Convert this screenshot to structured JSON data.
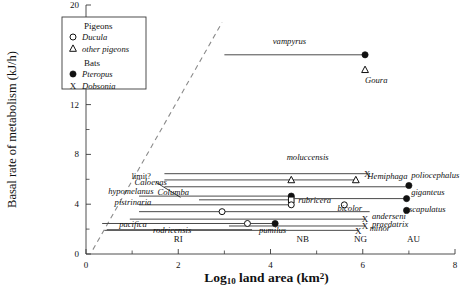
{
  "chart_data": {
    "type": "scatter",
    "title": "",
    "xlabel": "Log10 land area (km2)",
    "ylabel": "Basal rate of metabolism (kJ/h)",
    "xlim": [
      0,
      8
    ],
    "ylim": [
      0,
      20
    ],
    "xticks": [
      0,
      2,
      4,
      6,
      8
    ],
    "xticklabels": [
      "0",
      "2",
      "4",
      "6",
      "8"
    ],
    "xminor": [
      1,
      3,
      5,
      7
    ],
    "yticks": [
      0,
      4,
      8,
      12,
      16,
      20
    ],
    "yticklabels": [
      "0",
      "4",
      "8",
      "12",
      "16",
      "20"
    ],
    "yminor": [
      2,
      6,
      10,
      14,
      18
    ],
    "grid": false,
    "legend": {
      "position": "upper-left",
      "groups": [
        {
          "heading": "Pigeons",
          "entries": [
            {
              "marker": "open-circle",
              "label": "Ducula"
            },
            {
              "marker": "open-triangle",
              "label": "other pigeons"
            }
          ]
        },
        {
          "heading": "Bats",
          "entries": [
            {
              "marker": "filled-circle",
              "label": "Pteropus"
            },
            {
              "marker": "cross-x",
              "label": "Dobsonia"
            }
          ]
        }
      ]
    },
    "annotations": [
      {
        "text": "limit?",
        "x": 1.2,
        "y": 6.0,
        "note": "label for dashed upper-limit line"
      },
      {
        "text": "RI",
        "x": 2.0,
        "y": 0.95,
        "note": "region tick label"
      },
      {
        "text": "NB",
        "x": 4.7,
        "y": 0.95,
        "note": "region tick label"
      },
      {
        "text": "NG",
        "x": 5.95,
        "y": 0.95,
        "note": "region tick label"
      },
      {
        "text": "AU",
        "x": 7.1,
        "y": 0.95,
        "note": "region tick label"
      }
    ],
    "limit_line": {
      "type": "dashed",
      "x0": 0.15,
      "y0": 0.35,
      "x1": 2.95,
      "y1": 18.6
    },
    "series": [
      {
        "name": "vampyrus",
        "label": "vampyrus",
        "label_x": 4.05,
        "label_y": 16.9,
        "line": {
          "x0": 3.0,
          "y0": 16.0,
          "x1": 6.05,
          "y1": 16.0
        },
        "points": [
          {
            "x": 6.05,
            "y": 16.0,
            "marker": "filled-circle"
          }
        ]
      },
      {
        "name": "Goura",
        "label": "Goura",
        "label_x": 6.05,
        "label_y": 13.7,
        "points": [
          {
            "x": 6.05,
            "y": 14.8,
            "marker": "open-triangle"
          }
        ]
      },
      {
        "name": "moluccensis",
        "label": "moluccensis",
        "label_x": 4.35,
        "label_y": 7.55,
        "line": {
          "x0": 1.7,
          "y0": 6.45,
          "x1": 6.1,
          "y1": 6.45
        },
        "points": [
          {
            "x": 6.1,
            "y": 6.45,
            "marker": "cross-x"
          }
        ]
      },
      {
        "name": "Hemiphaga",
        "label": "Hemiphaga",
        "label_x": 6.1,
        "label_y": 6.0,
        "line": {
          "x0": 1.7,
          "y0": 5.95,
          "x1": 5.85,
          "y1": 5.95
        },
        "points": [
          {
            "x": 4.45,
            "y": 5.95,
            "marker": "open-triangle"
          },
          {
            "x": 5.85,
            "y": 5.95,
            "marker": "open-triangle"
          }
        ]
      },
      {
        "name": "Caloenas",
        "label": "Caloenas",
        "label_x": 1.05,
        "label_y": 5.55,
        "line": {
          "x0": 1.7,
          "y0": 5.4,
          "x1": 7.0,
          "y1": 5.4
        }
      },
      {
        "name": "poliocephalus",
        "label": "poliocephalus",
        "label_x": 7.05,
        "label_y": 6.1,
        "points": [
          {
            "x": 7.0,
            "y": 5.5,
            "marker": "filled-circle"
          }
        ]
      },
      {
        "name": "hypomelanus",
        "label": "hypomelanus",
        "label_x": 0.48,
        "label_y": 4.8,
        "line": {
          "x0": 1.15,
          "y0": 4.65,
          "x1": 4.45,
          "y1": 4.65
        },
        "points": [
          {
            "x": 4.45,
            "y": 4.65,
            "marker": "filled-circle"
          }
        ]
      },
      {
        "name": "Columba",
        "label": "Columba",
        "label_x": 1.55,
        "label_y": 4.75,
        "line": {
          "x0": 2.45,
          "y0": 4.35,
          "x1": 4.45,
          "y1": 4.35
        },
        "points": [
          {
            "x": 4.45,
            "y": 4.35,
            "marker": "open-square"
          }
        ]
      },
      {
        "name": "giganteus",
        "label": "giganteus",
        "label_x": 7.05,
        "label_y": 4.7,
        "line": {
          "x0": 4.5,
          "y0": 4.45,
          "x1": 6.95,
          "y1": 4.45
        },
        "points": [
          {
            "x": 6.95,
            "y": 4.45,
            "marker": "filled-circle"
          }
        ]
      },
      {
        "name": "rubricera",
        "label": "rubricera",
        "label_x": 4.6,
        "label_y": 4.1,
        "line": {
          "x0": 1.15,
          "y0": 3.95,
          "x1": 4.45,
          "y1": 3.95
        },
        "points": [
          {
            "x": 4.45,
            "y": 3.95,
            "marker": "open-circle"
          }
        ]
      },
      {
        "name": "pistrinaria",
        "label": "pistrinaria",
        "label_x": 0.62,
        "label_y": 3.95,
        "line": {
          "x0": 1.15,
          "y0": 3.4,
          "x1": 6.15,
          "y1": 3.4
        },
        "points": [
          {
            "x": 2.95,
            "y": 3.4,
            "marker": "open-circle"
          }
        ]
      },
      {
        "name": "bicolor",
        "label": "bicolor",
        "label_x": 5.45,
        "label_y": 3.45,
        "points": [
          {
            "x": 5.6,
            "y": 3.95,
            "marker": "open-circle"
          }
        ]
      },
      {
        "name": "scapulatus",
        "label": "scapulatus",
        "label_x": 7.0,
        "label_y": 3.35,
        "points": [
          {
            "x": 6.95,
            "y": 3.5,
            "marker": "filled-circle"
          }
        ]
      },
      {
        "name": "anderseni",
        "label": "anderseni",
        "label_x": 6.2,
        "label_y": 2.85,
        "line": {
          "x0": 0.95,
          "y0": 2.8,
          "x1": 6.05,
          "y1": 2.8
        },
        "points": [
          {
            "x": 6.05,
            "y": 2.8,
            "marker": "cross-x"
          }
        ]
      },
      {
        "name": "praedatrix",
        "label": "praedatrix",
        "label_x": 6.2,
        "label_y": 2.2,
        "line": {
          "x0": 3.1,
          "y0": 2.25,
          "x1": 6.05,
          "y1": 2.25
        },
        "points": [
          {
            "x": 6.05,
            "y": 2.25,
            "marker": "cross-x"
          }
        ]
      },
      {
        "name": "pacifica",
        "label": "pacifica",
        "label_x": 0.72,
        "label_y": 2.15,
        "line": {
          "x0": 0.35,
          "y0": 2.45,
          "x1": 4.1,
          "y1": 2.45
        },
        "points": [
          {
            "x": 3.5,
            "y": 2.45,
            "marker": "open-circle"
          },
          {
            "x": 4.1,
            "y": 2.45,
            "marker": "filled-circle"
          }
        ]
      },
      {
        "name": "rodricensis",
        "label": "rodricensis",
        "label_x": 1.45,
        "label_y": 1.65,
        "line": {
          "x0": 0.45,
          "y0": 1.95,
          "x1": 3.6,
          "y1": 1.95
        }
      },
      {
        "name": "pumilus",
        "label": "pumilus",
        "label_x": 3.75,
        "label_y": 1.65,
        "line": {
          "x0": 0.4,
          "y0": 1.9,
          "x1": 5.9,
          "y1": 1.9
        },
        "points": [
          {
            "x": 5.9,
            "y": 1.9,
            "marker": "cross-x"
          }
        ]
      },
      {
        "name": "minor",
        "label": "minor",
        "label_x": 6.15,
        "label_y": 1.85
      }
    ]
  },
  "colors": {
    "axis": "#3a3a3a",
    "line": "#4a4a4a",
    "marker": "#111111",
    "limit": "#8a8a8a",
    "text": "#111111",
    "background": "#ffffff"
  }
}
